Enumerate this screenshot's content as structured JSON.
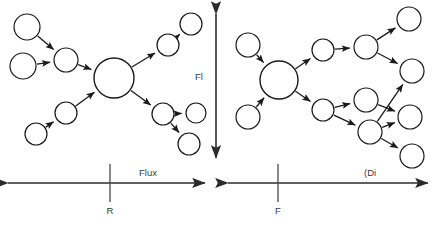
{
  "figure": {
    "background_color": "#ffffff",
    "stroke_color": "#1a1a1a",
    "text_color": "#3a3a3a",
    "width": 434,
    "height": 232
  },
  "axes": {
    "vertical": {
      "label": "Fl",
      "name": "vertical-double-arrow-axis",
      "x": 216,
      "y_top": 14,
      "y_bottom": 158,
      "label_x": 199,
      "label_y": 80,
      "arrow_both_ends": true
    },
    "left_horizontal": {
      "label": "Flux",
      "tick_label": "R",
      "name": "left-horizontal-axis",
      "x_start": 8,
      "x_end": 205,
      "y": 183,
      "tick_x": 110,
      "tick_top": 164,
      "tick_bottom": 202,
      "label_x": 139,
      "label_y": 176,
      "tick_label_x": 110,
      "tick_label_y": 214,
      "arrow_both_ends": true
    },
    "right_horizontal": {
      "label": "(Di",
      "tick_label": "F",
      "name": "right-horizontal-axis",
      "x_start": 228,
      "x_end": 428,
      "y": 183,
      "tick_x": 278,
      "tick_top": 164,
      "tick_bottom": 202,
      "label_x": 364,
      "label_y": 176,
      "tick_label_x": 278,
      "tick_label_y": 214,
      "arrow_both_ends": true
    }
  },
  "graphs": [
    {
      "name": "left-network-graph",
      "title": "Flux network R",
      "nodes": [
        {
          "id": "L1",
          "cx": 27,
          "cy": 27,
          "r": 13
        },
        {
          "id": "L2",
          "cx": 23,
          "cy": 66,
          "r": 13
        },
        {
          "id": "L3",
          "cx": 66,
          "cy": 60,
          "r": 12
        },
        {
          "id": "L4",
          "cx": 114,
          "cy": 78,
          "r": 20
        },
        {
          "id": "L5",
          "cx": 168,
          "cy": 45,
          "r": 11
        },
        {
          "id": "L6",
          "cx": 191,
          "cy": 24,
          "r": 11
        },
        {
          "id": "L7",
          "cx": 66,
          "cy": 113,
          "r": 11
        },
        {
          "id": "L8",
          "cx": 36,
          "cy": 134,
          "r": 11
        },
        {
          "id": "L9",
          "cx": 163,
          "cy": 114,
          "r": 11
        },
        {
          "id": "L10",
          "cx": 196,
          "cy": 113,
          "r": 10
        },
        {
          "id": "L11",
          "cx": 189,
          "cy": 144,
          "r": 11
        }
      ],
      "edges": [
        {
          "from": "L1",
          "to": "L3"
        },
        {
          "from": "L2",
          "to": "L3"
        },
        {
          "from": "L3",
          "to": "L4"
        },
        {
          "from": "L4",
          "to": "L5"
        },
        {
          "from": "L5",
          "to": "L6"
        },
        {
          "from": "L8",
          "to": "L7"
        },
        {
          "from": "L7",
          "to": "L4"
        },
        {
          "from": "L4",
          "to": "L9"
        },
        {
          "from": "L9",
          "to": "L10"
        },
        {
          "from": "L9",
          "to": "L11"
        }
      ]
    },
    {
      "name": "right-network-graph",
      "title": "Distribution network F",
      "nodes": [
        {
          "id": "R1",
          "cx": 248,
          "cy": 45,
          "r": 12
        },
        {
          "id": "R2",
          "cx": 248,
          "cy": 117,
          "r": 12
        },
        {
          "id": "R3",
          "cx": 279,
          "cy": 80,
          "r": 19
        },
        {
          "id": "R4",
          "cx": 323,
          "cy": 50,
          "r": 11
        },
        {
          "id": "R5",
          "cx": 323,
          "cy": 110,
          "r": 11
        },
        {
          "id": "R6",
          "cx": 366,
          "cy": 47,
          "r": 12
        },
        {
          "id": "R7",
          "cx": 366,
          "cy": 100,
          "r": 12
        },
        {
          "id": "R8",
          "cx": 370,
          "cy": 132,
          "r": 12
        },
        {
          "id": "R9",
          "cx": 409,
          "cy": 19,
          "r": 12
        },
        {
          "id": "R10",
          "cx": 412,
          "cy": 71,
          "r": 12
        },
        {
          "id": "R11",
          "cx": 410,
          "cy": 117,
          "r": 12
        },
        {
          "id": "R12",
          "cx": 412,
          "cy": 156,
          "r": 12
        }
      ],
      "edges": [
        {
          "from": "R1",
          "to": "R3"
        },
        {
          "from": "R2",
          "to": "R3"
        },
        {
          "from": "R3",
          "to": "R4"
        },
        {
          "from": "R3",
          "to": "R5"
        },
        {
          "from": "R4",
          "to": "R6"
        },
        {
          "from": "R5",
          "to": "R7"
        },
        {
          "from": "R5",
          "to": "R8"
        },
        {
          "from": "R6",
          "to": "R9"
        },
        {
          "from": "R6",
          "to": "R10"
        },
        {
          "from": "R7",
          "to": "R11"
        },
        {
          "from": "R8",
          "to": "R10"
        },
        {
          "from": "R8",
          "to": "R11"
        },
        {
          "from": "R8",
          "to": "R12"
        }
      ]
    }
  ]
}
